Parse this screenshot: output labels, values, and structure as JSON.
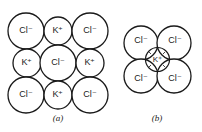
{
  "figure": {
    "panel_a": {
      "caption": "(a)",
      "grid": [
        [
          {
            "ion": "Cl⁻",
            "type": "large"
          },
          {
            "ion": "K⁺",
            "type": "small"
          },
          {
            "ion": "Cl⁻",
            "type": "large"
          }
        ],
        [
          {
            "ion": "K⁺",
            "type": "small"
          },
          {
            "ion": "Cl⁻",
            "type": "large"
          },
          {
            "ion": "K⁺",
            "type": "small"
          }
        ],
        [
          {
            "ion": "Cl⁻",
            "type": "large"
          },
          {
            "ion": "K⁺",
            "type": "small"
          },
          {
            "ion": "Cl⁻",
            "type": "large"
          }
        ]
      ]
    },
    "panel_b": {
      "caption": "(b)",
      "outer": [
        "Cl⁻",
        "Cl⁻",
        "Cl⁻",
        "Cl⁻"
      ],
      "center": "K⁺",
      "tangent_marks": [
        "x",
        "x",
        "x",
        "x"
      ]
    }
  }
}
